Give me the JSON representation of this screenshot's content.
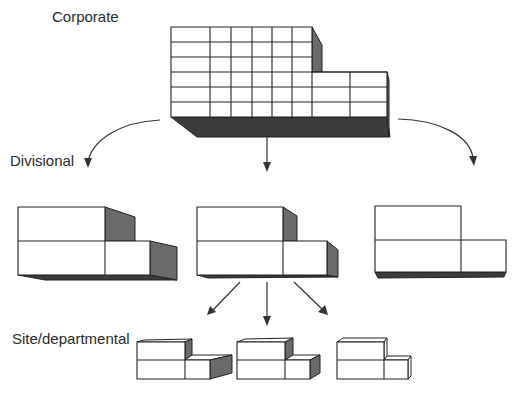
{
  "diagram": {
    "levels": [
      {
        "id": "corporate",
        "label": "Corporate"
      },
      {
        "id": "divisional",
        "label": "Divisional"
      },
      {
        "id": "site",
        "label": "Site/departmental"
      }
    ],
    "corporate": {
      "rows": 6,
      "columns_upper": 6,
      "columns_lower": 8
    },
    "divisional_blocks": 3,
    "site_blocks": 3,
    "edges": [
      {
        "from": "corporate",
        "to": "divisional-1"
      },
      {
        "from": "corporate",
        "to": "divisional-2"
      },
      {
        "from": "corporate",
        "to": "divisional-3"
      },
      {
        "from": "divisional-2",
        "to": "site-1"
      },
      {
        "from": "divisional-2",
        "to": "site-2"
      },
      {
        "from": "divisional-2",
        "to": "site-3"
      }
    ]
  }
}
